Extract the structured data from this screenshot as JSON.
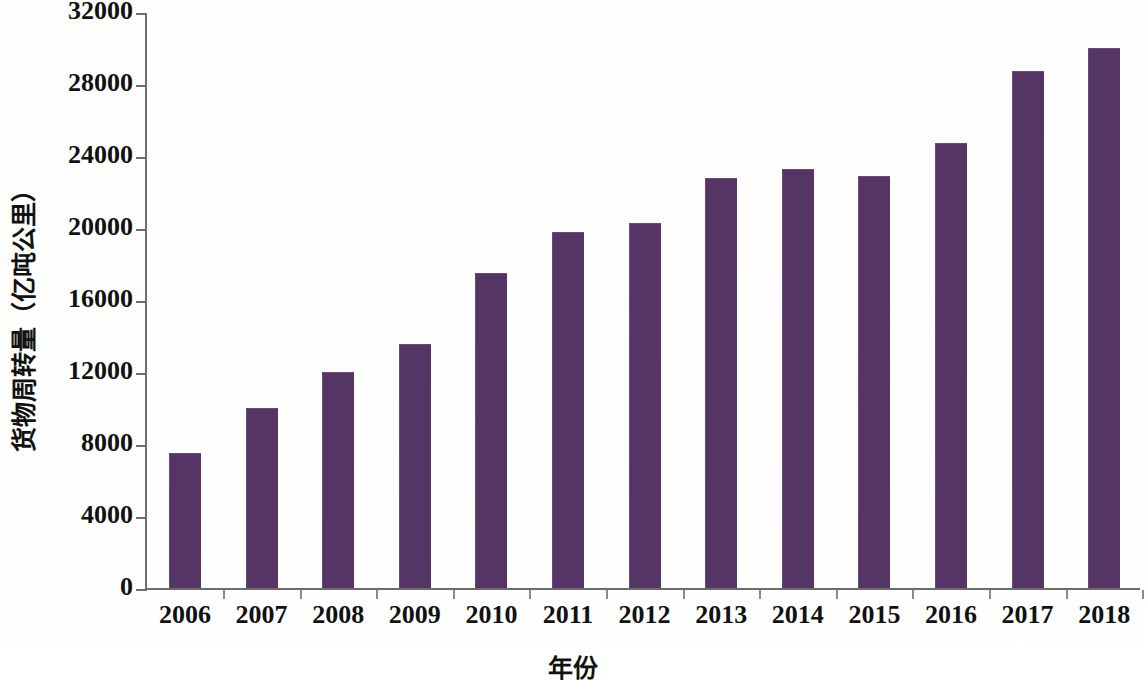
{
  "chart_data": {
    "type": "bar",
    "title": "",
    "xlabel": "年份",
    "ylabel": "货物周转量（亿吨公里）",
    "categories": [
      "2006",
      "2007",
      "2008",
      "2009",
      "2010",
      "2011",
      "2012",
      "2013",
      "2014",
      "2015",
      "2016",
      "2017",
      "2018"
    ],
    "values": [
      7500,
      10000,
      12000,
      13550,
      17500,
      19800,
      20300,
      22800,
      23300,
      22900,
      24700,
      28750,
      30000
    ],
    "series": [
      {
        "name": "货物周转量",
        "values": [
          7500,
          10000,
          12000,
          13550,
          17500,
          19800,
          20300,
          22800,
          23300,
          22900,
          24700,
          28750,
          30000
        ]
      }
    ],
    "ylim": [
      0,
      32000
    ],
    "ytick_labels": [
      "0",
      "4000",
      "8000",
      "12000",
      "16000",
      "20000",
      "24000",
      "28000",
      "32000"
    ],
    "ytick_values": [
      0,
      4000,
      8000,
      12000,
      16000,
      20000,
      24000,
      28000,
      32000
    ],
    "grid": false,
    "legend": false,
    "legend_position": "none",
    "bar_color": "#553566",
    "axis_color": "#6d6d6d",
    "text_color": "#111111",
    "background_color": "#ffffff"
  }
}
